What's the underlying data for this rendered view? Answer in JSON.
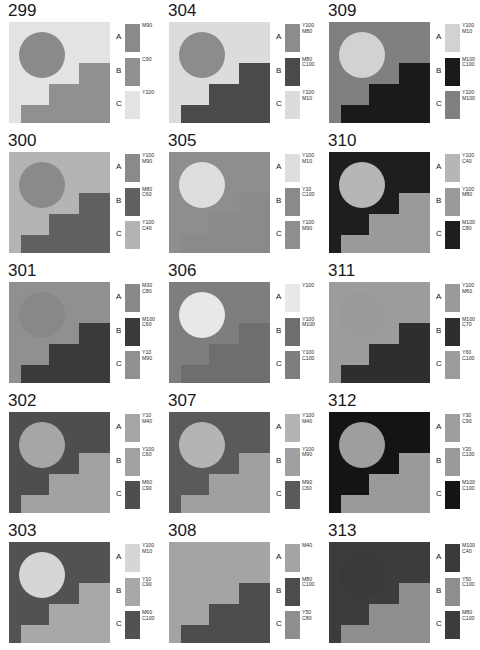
{
  "sheet": {
    "columns": 3,
    "rows": 5,
    "legend_letters": [
      "A",
      "B",
      "C"
    ]
  },
  "panels": [
    {
      "number": "299",
      "background": "#e3e3e3",
      "circle": "#8a8a8a",
      "stair": "#909090",
      "has_circle": true,
      "swatches": [
        {
          "letter": "A",
          "label": "M90",
          "color": "#8a8a8a"
        },
        {
          "letter": "B",
          "label": "C90",
          "color": "#909090"
        },
        {
          "letter": "C",
          "label": "Y100",
          "color": "#e3e3e3"
        }
      ]
    },
    {
      "number": "304",
      "background": "#dcdcdc",
      "circle": "#8c8c8c",
      "stair": "#4a4a4a",
      "has_circle": true,
      "swatches": [
        {
          "letter": "A",
          "label": "Y100\nM80",
          "color": "#8c8c8c"
        },
        {
          "letter": "B",
          "label": "M80\nC100",
          "color": "#4a4a4a"
        },
        {
          "letter": "C",
          "label": "Y100\nM10",
          "color": "#dcdcdc"
        }
      ]
    },
    {
      "number": "309",
      "background": "#808080",
      "circle": "#d2d2d2",
      "stair": "#1a1a1a",
      "has_circle": true,
      "swatches": [
        {
          "letter": "A",
          "label": "Y100\nM10",
          "color": "#d2d2d2"
        },
        {
          "letter": "B",
          "label": "M100\nC100",
          "color": "#1a1a1a"
        },
        {
          "letter": "C",
          "label": "Y100\nM100",
          "color": "#808080"
        }
      ]
    },
    {
      "number": "300",
      "background": "#b4b4b4",
      "circle": "#8a8a8a",
      "stair": "#606060",
      "has_circle": true,
      "swatches": [
        {
          "letter": "A",
          "label": "Y100\nM90",
          "color": "#8a8a8a"
        },
        {
          "letter": "B",
          "label": "M80\nC60",
          "color": "#606060"
        },
        {
          "letter": "C",
          "label": "Y100\nC40",
          "color": "#b4b4b4"
        }
      ]
    },
    {
      "number": "305",
      "background": "#8e8e8e",
      "circle": "#dedede",
      "stair": "#8a8a8a",
      "has_circle": true,
      "swatches": [
        {
          "letter": "A",
          "label": "Y100\nM10",
          "color": "#dedede"
        },
        {
          "letter": "B",
          "label": "Y10\nC100",
          "color": "#8a8a8a"
        },
        {
          "letter": "C",
          "label": "Y100\nM90",
          "color": "#8e8e8e"
        }
      ]
    },
    {
      "number": "310",
      "background": "#1e1e1e",
      "circle": "#b6b6b6",
      "stair": "#9a9a9a",
      "has_circle": true,
      "swatches": [
        {
          "letter": "A",
          "label": "Y100\nC40",
          "color": "#b6b6b6"
        },
        {
          "letter": "B",
          "label": "Y100\nM80",
          "color": "#9a9a9a"
        },
        {
          "letter": "C",
          "label": "M100\nC80",
          "color": "#1e1e1e"
        }
      ]
    },
    {
      "number": "301",
      "background": "#909090",
      "circle": "#888888",
      "stair": "#3a3a3a",
      "has_circle": true,
      "swatches": [
        {
          "letter": "A",
          "label": "M30\nC80",
          "color": "#888888"
        },
        {
          "letter": "B",
          "label": "M100\nC60",
          "color": "#3a3a3a"
        },
        {
          "letter": "C",
          "label": "Y10\nM90",
          "color": "#909090"
        }
      ]
    },
    {
      "number": "306",
      "background": "#7e7e7e",
      "circle": "#e8e8e8",
      "stair": "#6e6e6e",
      "has_circle": true,
      "swatches": [
        {
          "letter": "A",
          "label": "Y100",
          "color": "#e8e8e8"
        },
        {
          "letter": "B",
          "label": "Y100\nM100",
          "color": "#6e6e6e"
        },
        {
          "letter": "C",
          "label": "Y100\nC100",
          "color": "#7e7e7e"
        }
      ]
    },
    {
      "number": "311",
      "background": "#9c9c9c",
      "circle": "#9a9a9a",
      "stair": "#2e2e2e",
      "has_circle": true,
      "swatches": [
        {
          "letter": "A",
          "label": "Y100\nM60",
          "color": "#9a9a9a"
        },
        {
          "letter": "B",
          "label": "M100\nC70",
          "color": "#2e2e2e"
        },
        {
          "letter": "C",
          "label": "Y60\nC100",
          "color": "#9c9c9c"
        }
      ]
    },
    {
      "number": "302",
      "background": "#4e4e4e",
      "circle": "#a6a6a6",
      "stair": "#a2a2a2",
      "has_circle": true,
      "swatches": [
        {
          "letter": "A",
          "label": "Y10\nM40",
          "color": "#a6a6a6"
        },
        {
          "letter": "B",
          "label": "Y100\nC60",
          "color": "#a2a2a2"
        },
        {
          "letter": "C",
          "label": "M60\nC90",
          "color": "#4e4e4e"
        }
      ]
    },
    {
      "number": "307",
      "background": "#5a5a5a",
      "circle": "#b4b4b4",
      "stair": "#a0a0a0",
      "has_circle": true,
      "swatches": [
        {
          "letter": "A",
          "label": "Y100\nM40",
          "color": "#b4b4b4"
        },
        {
          "letter": "B",
          "label": "Y100\nM90",
          "color": "#a0a0a0"
        },
        {
          "letter": "C",
          "label": "M90\nC60",
          "color": "#5a5a5a"
        }
      ]
    },
    {
      "number": "312",
      "background": "#141414",
      "circle": "#9e9e9e",
      "stair": "#9a9a9a",
      "has_circle": true,
      "swatches": [
        {
          "letter": "A",
          "label": "Y30\nC90",
          "color": "#9e9e9e"
        },
        {
          "letter": "B",
          "label": "Y20\nC100",
          "color": "#9a9a9a"
        },
        {
          "letter": "C",
          "label": "M100\nC100",
          "color": "#141414"
        }
      ]
    },
    {
      "number": "303",
      "background": "#525252",
      "circle": "#d6d6d6",
      "stair": "#a8a8a8",
      "has_circle": true,
      "swatches": [
        {
          "letter": "A",
          "label": "Y100\nM10",
          "color": "#d6d6d6"
        },
        {
          "letter": "B",
          "label": "Y10\nC90",
          "color": "#a8a8a8"
        },
        {
          "letter": "C",
          "label": "M60\nC100",
          "color": "#525252"
        }
      ]
    },
    {
      "number": "308",
      "background": "#a4a4a4",
      "circle": "#a4a4a4",
      "stair": "#4c4c4c",
      "has_circle": false,
      "swatches": [
        {
          "letter": "A",
          "label": "M40",
          "color": "#a4a4a4"
        },
        {
          "letter": "B",
          "label": "M80\nC100",
          "color": "#4c4c4c"
        },
        {
          "letter": "C",
          "label": "Y50\nC80",
          "color": "#8e8e8e"
        }
      ]
    },
    {
      "number": "313",
      "background": "#3c3c3c",
      "circle": "#3a3a3a",
      "stair": "#8e8e8e",
      "has_circle": true,
      "swatches": [
        {
          "letter": "A",
          "label": "M100\nC40",
          "color": "#3a3a3a"
        },
        {
          "letter": "B",
          "label": "Y50\nC100",
          "color": "#8e8e8e"
        },
        {
          "letter": "C",
          "label": "M80\nC100",
          "color": "#3c3c3c"
        }
      ]
    }
  ]
}
